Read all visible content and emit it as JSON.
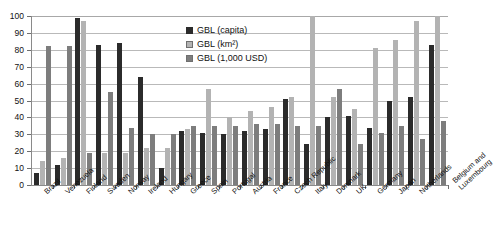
{
  "chart_data": {
    "type": "bar",
    "title": "",
    "xlabel": "",
    "ylabel": "",
    "ylim": [
      0,
      100
    ],
    "yticks": [
      0,
      10,
      20,
      30,
      40,
      50,
      60,
      70,
      80,
      90,
      100
    ],
    "grid": true,
    "legend_position": "inside-top-center",
    "categories": [
      "Brazil",
      "Venezuela",
      "Finland",
      "Sweden",
      "Norway",
      "Ireland",
      "Hungary",
      "Greece",
      "Spain",
      "Portugal",
      "Austria",
      "France",
      "Czech Republic",
      "Italy",
      "Denmark",
      "UK",
      "Germany",
      "Japan",
      "Netherlands",
      "Belgium and Luxembourg"
    ],
    "series": [
      {
        "name": "GBL (capita)",
        "color": "#2b2b2b",
        "values": [
          7,
          12,
          99,
          83,
          84,
          64,
          10,
          32,
          31,
          30,
          32,
          33,
          51,
          24,
          40,
          41,
          34,
          50,
          52,
          83
        ]
      },
      {
        "name": "GBL (km²)",
        "color": "#b3b3b3",
        "values": [
          14,
          16,
          97,
          19,
          19,
          22,
          22,
          33,
          57,
          40,
          44,
          46,
          52,
          100,
          52,
          45,
          81,
          86,
          97,
          100
        ]
      },
      {
        "name": "GBL (1,000 USD)",
        "color": "#7d7d7d",
        "values": [
          82,
          82,
          19,
          55,
          34,
          30,
          30,
          35,
          35,
          35,
          36,
          36,
          35,
          35,
          57,
          24,
          31,
          35,
          27,
          38
        ]
      }
    ]
  },
  "legend": {
    "items": [
      {
        "label": "GBL (capita)",
        "swatch": "capita"
      },
      {
        "label": "GBL (km²)",
        "swatch": "km2"
      },
      {
        "label": "GBL (1,000 USD)",
        "swatch": "usd"
      }
    ]
  }
}
